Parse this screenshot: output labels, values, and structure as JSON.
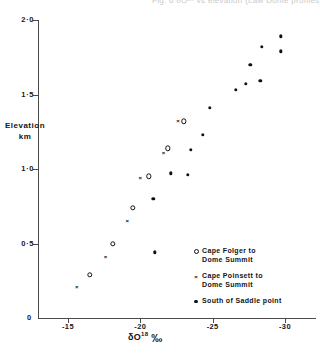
{
  "figure": {
    "top_caption": "Fig. 6  δO¹⁸  vs  elevation  (Law Dome profiles)",
    "origin_label": "0"
  },
  "chart_data": {
    "type": "scatter",
    "title": "",
    "xlabel": "δO¹⁸ ‰",
    "ylabel": "Elevation km",
    "xlim": [
      -12.5,
      -32.0
    ],
    "ylim": [
      0,
      2.0
    ],
    "grid": false,
    "legend_position": "lower-right",
    "xticks": [
      -15,
      -20,
      -25,
      -30
    ],
    "xticklabels": [
      "-15",
      "-20",
      "-25",
      "-30"
    ],
    "yticks": [
      0,
      0.5,
      1.0,
      1.5,
      2.0
    ],
    "yticklabels": [
      "0",
      "0·5",
      "1·0",
      "1·5",
      "2·0"
    ],
    "series": [
      {
        "name": "Cape Folger to Dome Summit",
        "marker": "open-circle",
        "points": [
          {
            "x": -16.5,
            "y": 0.29
          },
          {
            "x": -18.1,
            "y": 0.5
          },
          {
            "x": -19.5,
            "y": 0.74
          },
          {
            "x": -20.6,
            "y": 0.95
          },
          {
            "x": -21.9,
            "y": 1.14
          },
          {
            "x": -23.0,
            "y": 1.32
          }
        ]
      },
      {
        "name": "Cape Poinsett to Dome Summit",
        "marker": "cross",
        "points": [
          {
            "x": -15.6,
            "y": 0.21
          },
          {
            "x": -17.6,
            "y": 0.41
          },
          {
            "x": -19.1,
            "y": 0.65
          },
          {
            "x": -20.0,
            "y": 0.94
          },
          {
            "x": -21.6,
            "y": 1.11
          },
          {
            "x": -22.6,
            "y": 1.32
          }
        ]
      },
      {
        "name": "South of Saddle point",
        "marker": "filled-dot",
        "points": [
          {
            "x": -20.9,
            "y": 0.8
          },
          {
            "x": -22.1,
            "y": 0.97
          },
          {
            "x": -23.3,
            "y": 0.96
          },
          {
            "x": -23.5,
            "y": 1.13
          },
          {
            "x": -24.3,
            "y": 1.23
          },
          {
            "x": -24.8,
            "y": 1.41
          },
          {
            "x": -26.6,
            "y": 1.53
          },
          {
            "x": -27.3,
            "y": 1.57
          },
          {
            "x": -27.6,
            "y": 1.7
          },
          {
            "x": -28.3,
            "y": 1.59
          },
          {
            "x": -28.4,
            "y": 1.82
          },
          {
            "x": -29.7,
            "y": 1.79
          },
          {
            "x": -29.7,
            "y": 1.89
          },
          {
            "x": -21.0,
            "y": 0.44
          }
        ]
      }
    ],
    "legend": [
      {
        "marker": "open-circle",
        "label": "Cape  Folger  to\nDome  Summit"
      },
      {
        "marker": "cross",
        "label": "Cape  Poinsett to\nDome  Summit"
      },
      {
        "marker": "filled-dot",
        "label": "South of Saddle  point"
      }
    ]
  }
}
